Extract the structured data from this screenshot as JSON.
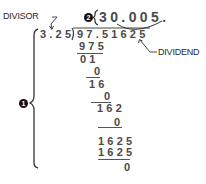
{
  "labels": {
    "divisor": "DIVISOR",
    "dividend": "DIVIDEND"
  },
  "markers": {
    "step1": "1",
    "step2": "2"
  },
  "quotient": "30.005.",
  "divisor": "3.25",
  "dividend": "97.51625",
  "steps": [
    {
      "value": "975"
    },
    {
      "value": "01"
    },
    {
      "value": "0"
    },
    {
      "value": "16"
    },
    {
      "value": "0"
    },
    {
      "value": "162"
    },
    {
      "value": "0"
    },
    {
      "value": "1625"
    },
    {
      "value": "1625"
    },
    {
      "value": "0"
    }
  ]
}
